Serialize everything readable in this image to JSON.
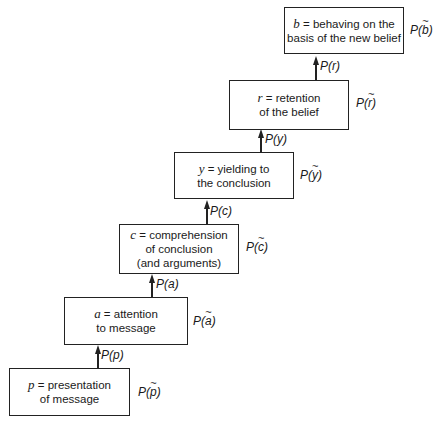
{
  "stages": [
    {
      "var": "p",
      "line1": "presentation",
      "line2": "of message",
      "line3": "",
      "prob_var": "p"
    },
    {
      "var": "a",
      "line1": "attention",
      "line2": "to message",
      "line3": "",
      "prob_var": "a"
    },
    {
      "var": "c",
      "line1": "comprehension",
      "line2": "of conclusion",
      "line3": "(and arguments)",
      "prob_var": "c"
    },
    {
      "var": "y",
      "line1": "yielding to",
      "line2": "the conclusion",
      "line3": "",
      "prob_var": "y"
    },
    {
      "var": "r",
      "line1": "retention",
      "line2": "of the belief",
      "line3": "",
      "prob_var": "r"
    },
    {
      "var": "b",
      "line1": "behaving on the",
      "line2": "basis of the new belief",
      "line3": "",
      "prob_var": "b"
    }
  ],
  "edges": [
    {
      "label": "P(p)"
    },
    {
      "label": "P(a)"
    },
    {
      "label": "P(c)"
    },
    {
      "label": "P(y)"
    },
    {
      "label": "P(r)"
    }
  ],
  "eq": "="
}
